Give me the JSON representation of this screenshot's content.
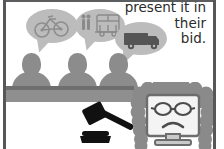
{
  "panel": {
    "type": "cartoon-illustration",
    "scene": "courtroom-bid-hearing",
    "background_color": "#ffffff",
    "frame_color": "#555759"
  },
  "caption": {
    "lines": [
      "present it in",
      "their",
      "bid."
    ],
    "full_text": "present it in their bid.",
    "align": "right",
    "color": "#2b2b2b"
  },
  "speech_bubbles": [
    {
      "id": "bubble-bicycle",
      "icon": "bicycle-icon",
      "label": "bicycle",
      "fill": "#bcbcbc",
      "stroke": "#8d8d8d"
    },
    {
      "id": "bubble-bus",
      "icon": "bus-icon",
      "label": "bus",
      "fill": "#bcbcbc",
      "stroke": "#8d8d8d"
    },
    {
      "id": "bubble-truck",
      "icon": "truck-icon",
      "label": "truck",
      "fill": "#bcbcbc",
      "stroke": "#8d8d8d"
    }
  ],
  "bidders": {
    "count": 3,
    "label": "bidder-silhouette",
    "color": "#8c8c8c"
  },
  "bench": {
    "label": "courtroom-bench",
    "color": "#8f8f8f",
    "lip_color": "#6e6e6e"
  },
  "gavel": {
    "label": "judge-gavel",
    "color": "#111111"
  },
  "judge": {
    "label": "computer-monitor-judge",
    "wig_color": "#8a8a8a",
    "screen_color": "#f4f4f4",
    "outline_color": "#6d6d6d",
    "expression": "frown",
    "accessory": "eyeglasses"
  }
}
